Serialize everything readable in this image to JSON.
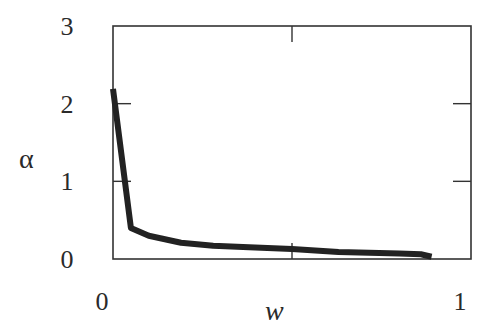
{
  "chart_data": {
    "type": "line",
    "title": "",
    "xlabel": "w",
    "ylabel": "α",
    "xlim": [
      0,
      1
    ],
    "ylim": [
      0,
      3
    ],
    "x_ticks": [
      0,
      0.5,
      1
    ],
    "x_tick_labels": [
      "0",
      "",
      "1"
    ],
    "y_ticks": [
      0,
      1,
      2,
      3
    ],
    "y_tick_labels": [
      "0",
      "1",
      "2",
      "3"
    ],
    "grid": false,
    "legend": null,
    "series": [
      {
        "name": "alpha",
        "color": "#222222",
        "x": [
          0.0,
          0.05,
          0.1,
          0.19,
          0.28,
          0.38,
          0.5,
          0.63,
          0.8,
          0.86,
          0.89
        ],
        "y": [
          2.19,
          0.4,
          0.3,
          0.21,
          0.17,
          0.15,
          0.13,
          0.09,
          0.07,
          0.06,
          0.03
        ]
      }
    ]
  },
  "layout": {
    "frame": {
      "left": 113,
      "right": 471,
      "top": 26,
      "bottom": 259
    },
    "frame_color": "#333333",
    "curve_width": 6
  }
}
